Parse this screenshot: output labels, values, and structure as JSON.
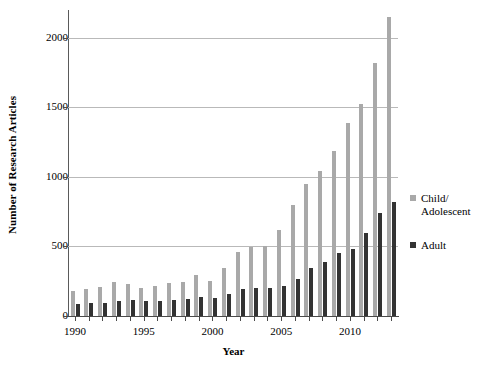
{
  "chart_data": {
    "type": "bar",
    "title": "",
    "xlabel": "Year",
    "ylabel": "Number of Research Articles",
    "ylim": [
      0,
      2200
    ],
    "yticks": [
      0,
      500,
      1000,
      1500,
      2000
    ],
    "ytick_labels": [
      "0",
      "500",
      "1000",
      "1500",
      "2000"
    ],
    "xtick_labels": [
      "1990",
      "1995",
      "2000",
      "2005",
      "2010"
    ],
    "xtick_years": [
      1990,
      1995,
      2000,
      2005,
      2010
    ],
    "grid": true,
    "legend_position": "right",
    "categories": [
      1990,
      1991,
      1992,
      1993,
      1994,
      1995,
      1996,
      1997,
      1998,
      1999,
      2000,
      2001,
      2002,
      2003,
      2004,
      2005,
      2006,
      2007,
      2008,
      2009,
      2010,
      2011,
      2012,
      2013
    ],
    "series": [
      {
        "name": "Child/Adolescent",
        "color": "#a9a9a9",
        "values": [
          180,
          195,
          210,
          245,
          230,
          205,
          215,
          235,
          245,
          295,
          255,
          345,
          460,
          495,
          500,
          615,
          800,
          950,
          1040,
          1185,
          1385,
          1525,
          1820,
          2150
        ]
      },
      {
        "name": "Adult",
        "color": "#333333",
        "values": [
          85,
          90,
          95,
          110,
          115,
          105,
          110,
          115,
          125,
          140,
          130,
          160,
          195,
          200,
          205,
          215,
          265,
          345,
          390,
          450,
          485,
          600,
          740,
          820
        ]
      }
    ]
  },
  "legend": {
    "entries": [
      {
        "label": "Child/\nAdolescent",
        "line1": "Child/",
        "line2": "Adolescent",
        "color": "#a9a9a9"
      },
      {
        "label": "Adult",
        "line1": "Adult",
        "line2": "",
        "color": "#333333"
      }
    ]
  }
}
